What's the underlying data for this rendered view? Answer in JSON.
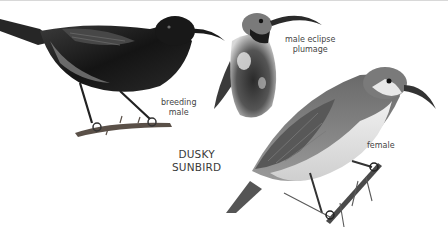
{
  "plate": {
    "title_lines": [
      "DUSKY",
      "SUNBIRD"
    ],
    "colors": {
      "background": "#ffffff",
      "text": "#444444",
      "male_plumage": "#1a1a1a",
      "female_plumage": "#8a8a8a",
      "female_underparts": "#e4e4e4",
      "perch": "#5a5048"
    }
  },
  "figures": [
    {
      "id": "breeding-male",
      "label_lines": [
        "breeding",
        "male"
      ]
    },
    {
      "id": "male-eclipse",
      "label_lines": [
        "male eclipse",
        "plumage"
      ]
    },
    {
      "id": "female",
      "label_lines": [
        "female"
      ]
    }
  ]
}
